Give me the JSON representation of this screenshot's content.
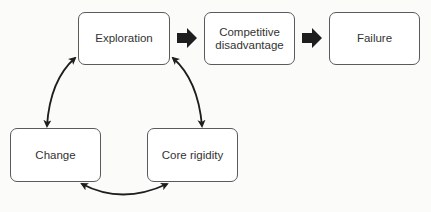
{
  "diagram": {
    "nodes": [
      {
        "id": "exploration",
        "label": "Exploration"
      },
      {
        "id": "competitive-disadvantage",
        "label": "Competitive\ndisadvantage"
      },
      {
        "id": "failure",
        "label": "Failure"
      },
      {
        "id": "change",
        "label": "Change"
      },
      {
        "id": "core-rigidity",
        "label": "Core rigidity"
      }
    ],
    "edges": [
      {
        "from": "exploration",
        "to": "competitive-disadvantage",
        "style": "thick-block-arrow"
      },
      {
        "from": "competitive-disadvantage",
        "to": "failure",
        "style": "thick-block-arrow"
      },
      {
        "from": "exploration",
        "to": "change",
        "style": "curved-double-arrow"
      },
      {
        "from": "exploration",
        "to": "core-rigidity",
        "style": "curved-double-arrow"
      },
      {
        "from": "change",
        "to": "core-rigidity",
        "style": "curved-double-arrow"
      }
    ],
    "colors": {
      "stroke": "#5a5a5a",
      "arrow": "#1e1e1e",
      "text": "#333333",
      "background": "#fbfbfa"
    }
  }
}
